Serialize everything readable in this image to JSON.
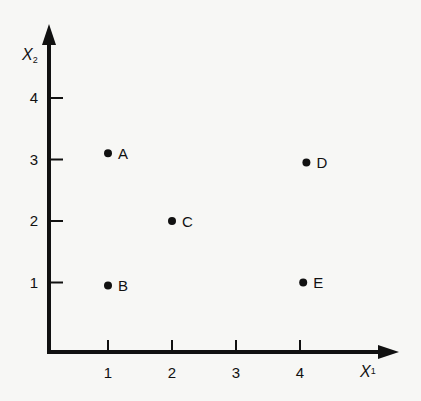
{
  "chart_data": {
    "type": "scatter",
    "title": "",
    "xlabel": "X₁",
    "ylabel": "X₂",
    "xlim": [
      0,
      4.5
    ],
    "ylim": [
      0,
      4.5
    ],
    "grid": false,
    "legend": null,
    "x_ticks": [
      "1",
      "2",
      "3",
      "4"
    ],
    "y_ticks": [
      "1",
      "2",
      "3",
      "4"
    ],
    "points": [
      {
        "label": "A",
        "x": 1,
        "y": 3.1
      },
      {
        "label": "B",
        "x": 1,
        "y": 0.95
      },
      {
        "label": "C",
        "x": 2,
        "y": 2
      },
      {
        "label": "D",
        "x": 4.1,
        "y": 2.95
      },
      {
        "label": "E",
        "x": 4.05,
        "y": 1
      }
    ]
  },
  "axes": {
    "x_label_main": "X",
    "x_label_sub": "1",
    "y_label_main": "X",
    "y_label_sub": "2"
  }
}
